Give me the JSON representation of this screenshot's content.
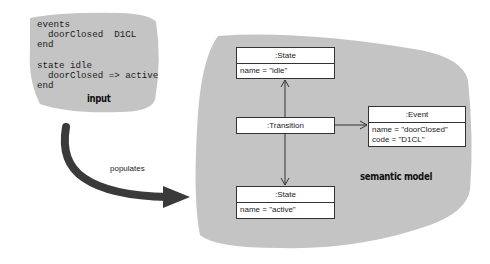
{
  "input": {
    "code_lines": [
      "events",
      "  doorClosed  D1CL",
      "end",
      "",
      "state idle",
      "  doorClosed => active",
      "end"
    ],
    "code": "events\n  doorClosed  D1CL\nend\n\nstate idle\n  doorClosed => active\nend",
    "label": "input"
  },
  "arrow": {
    "label": "populates"
  },
  "semantic_model": {
    "label": "semantic model",
    "objects": {
      "state_idle": {
        "header": ":State",
        "attributes": [
          "name = \"idle\""
        ]
      },
      "transition": {
        "header": ":Transition"
      },
      "event": {
        "header": ":Event",
        "attributes": [
          "name = \"doorClosed\"",
          "code = \"D1CL\""
        ]
      },
      "state_active": {
        "header": ":State",
        "attributes": [
          "name = \"active\""
        ]
      }
    },
    "links": [
      {
        "from": ":Transition",
        "to": ":State (idle)"
      },
      {
        "from": ":Transition",
        "to": ":Event"
      },
      {
        "from": ":Transition",
        "to": ":State (active)"
      }
    ]
  },
  "colors": {
    "blob_fill": "#c4c4c4",
    "arrow_fill": "#3a3a3a",
    "box_border": "#333333"
  }
}
